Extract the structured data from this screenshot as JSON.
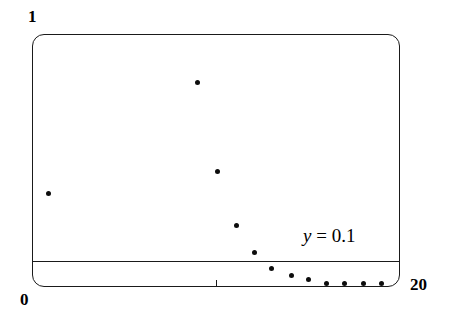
{
  "figure": {
    "axis_labels": {
      "y_max": "1",
      "y_min": "0",
      "x_max": "20"
    },
    "annotation": {
      "variable": "y",
      "rest": " = 0.1"
    }
  },
  "chart_data": {
    "type": "scatter",
    "title": "",
    "xlabel": "",
    "ylabel": "",
    "xlim": [
      0,
      20
    ],
    "ylim": [
      0,
      1
    ],
    "grid": false,
    "legend": null,
    "xticks": [
      0,
      10,
      20
    ],
    "xtick_labels": [
      "0",
      "",
      "20"
    ],
    "yticks": [
      0,
      1
    ],
    "ytick_labels": [
      "0",
      "1"
    ],
    "annotations": [
      {
        "text": "y = 0.1",
        "x": 16.4,
        "y": 0.26,
        "style": "italic-variable"
      }
    ],
    "reference_lines": [
      {
        "orientation": "horizontal",
        "y": 0.1,
        "label": "y = 0.1",
        "color": "#1a1a1a"
      }
    ],
    "x": [
      0.9,
      9.0,
      10.1,
      11.1,
      12.1,
      13.0,
      14.1,
      15.0,
      16.0,
      17.0,
      18.0,
      19.0
    ],
    "y": [
      0.368,
      0.81,
      0.455,
      0.245,
      0.138,
      0.075,
      0.047,
      0.028,
      0.012,
      0.012,
      0.012,
      0.012
    ],
    "marker": "circle",
    "marker_color": "#0d0d0d",
    "marker_size": 5
  }
}
